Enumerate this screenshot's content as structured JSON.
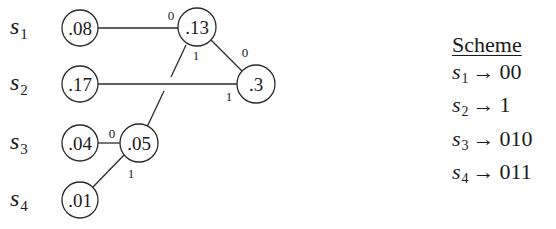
{
  "symbols": [
    {
      "base": "s",
      "sub": "1"
    },
    {
      "base": "s",
      "sub": "2"
    },
    {
      "base": "s",
      "sub": "3"
    },
    {
      "base": "s",
      "sub": "4"
    }
  ],
  "nodes": {
    "s1_leaf": ".08",
    "s2_leaf": ".17",
    "s3_leaf": ".04",
    "s4_leaf": ".01",
    "n13": ".13",
    "n3": ".3",
    "n05": ".05"
  },
  "edge_labels": {
    "s1_to_n13": "0",
    "n05_to_n13": "1",
    "n13_to_n3": "0",
    "s2_to_n3": "1",
    "s3_to_n05": "0",
    "s4_to_n05": "1"
  },
  "scheme": {
    "title": "Scheme",
    "arrow": "→",
    "rows": [
      {
        "base": "s",
        "sub": "1",
        "code": "00"
      },
      {
        "base": "s",
        "sub": "2",
        "code": "1"
      },
      {
        "base": "s",
        "sub": "3",
        "code": "010"
      },
      {
        "base": "s",
        "sub": "4",
        "code": "011"
      }
    ]
  }
}
